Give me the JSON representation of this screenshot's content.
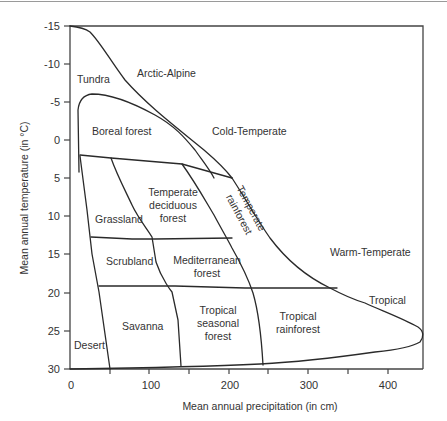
{
  "diagram": {
    "x_axis": {
      "label": "Mean annual precipitation (in cm)",
      "ticks": [
        "0",
        "100",
        "200",
        "300",
        "400"
      ]
    },
    "y_axis": {
      "label": "Mean annual temperature (in °C)",
      "ticks": [
        "-15",
        "-10",
        "-5",
        "0",
        "5",
        "10",
        "15",
        "20",
        "25",
        "30"
      ]
    },
    "zones": {
      "arctic_alpine": "Arctic-Alpine",
      "cold_temperate": "Cold-Temperate",
      "warm_temperate": "Warm-Temperate",
      "tropical": "Tropical"
    },
    "biomes": {
      "tundra": "Tundra",
      "boreal_forest": "Boreal forest",
      "temperate_deciduous_forest": [
        "Temperate",
        "deciduous",
        "forest"
      ],
      "temperate_rainforest": [
        "Temperate",
        "rainforest"
      ],
      "grassland": "Grassland",
      "scrubland": "Scrubland",
      "mediterranean_forest": [
        "Mediterranean",
        "forest"
      ],
      "savanna": "Savanna",
      "desert": "Desert",
      "tropical_seasonal_forest": [
        "Tropical",
        "seasonal",
        "forest"
      ],
      "tropical_rainforest": [
        "Tropical",
        "rainforest"
      ]
    }
  }
}
